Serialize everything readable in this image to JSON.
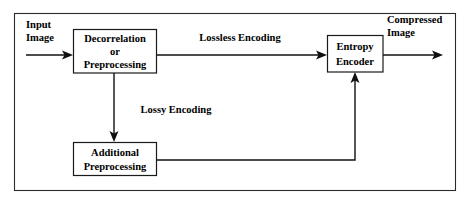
{
  "diagram": {
    "colors": {
      "background": "#ffffff",
      "frame_stroke": "#2b2b2b",
      "box_stroke": "#1a1a1a",
      "line_stroke": "#101010",
      "text": "#000000"
    },
    "nodes": [
      {
        "id": "decorrelation",
        "lines": [
          "Decorrelation",
          "or",
          "Preprocessing"
        ]
      },
      {
        "id": "entropy-encoder",
        "lines": [
          "Entropy",
          "Encoder"
        ]
      },
      {
        "id": "additional-preprocessing",
        "lines": [
          "Additional",
          "Preprocessing"
        ]
      }
    ],
    "io_labels": [
      {
        "id": "input-image",
        "lines": [
          "Input",
          "Image"
        ]
      },
      {
        "id": "compressed-image",
        "lines": [
          "Compressed",
          "Image"
        ]
      }
    ],
    "edge_labels": [
      {
        "id": "lossless-encoding",
        "text": "Lossless Encoding"
      },
      {
        "id": "lossy-encoding",
        "text": "Lossy Encoding"
      }
    ]
  }
}
